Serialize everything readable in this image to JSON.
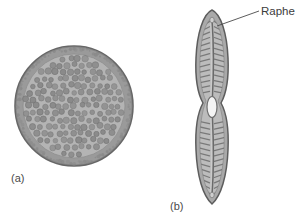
{
  "figure": {
    "type": "scientific-illustration",
    "background_color": "#ffffff",
    "width": 297,
    "height": 222
  },
  "panels": [
    {
      "id": "a",
      "label": "(a)",
      "label_x": 11,
      "label_y": 178,
      "shape": "centric",
      "description": "Circular centric diatom valve seen in valve view, with a granular marginal rim and numerous rounded areolae (pores) covering the face",
      "center_x": 74,
      "center_y": 106,
      "radius_x": 59,
      "radius_y": 60,
      "colors": {
        "rim_outer": "#6e6e6e",
        "rim_band": "#8f8f8f",
        "face_fill": "#b3b3b3",
        "areola_fill": "#8a8a8a",
        "areola_stroke": "#6f6f6f"
      },
      "areola_count": 168,
      "rim_granule_count": 120
    },
    {
      "id": "b",
      "label": "(b)",
      "label_x": 170,
      "label_y": 206,
      "shape": "pennate",
      "description": "Elongate pennate diatom valve with a longitudinal raphe slit, a central nodule, and transverse striae running perpendicular to the raphe on both sides",
      "center_x": 212,
      "center_y": 107,
      "length": 196,
      "width": 33,
      "colors": {
        "outline": "#5f5f5f",
        "body_fill": "#a8a8a8",
        "inner_fill": "#b8b8b8",
        "stria_stroke": "#707070",
        "raphe_stroke": "#6a6a6a",
        "central_nodule_fill": "#f2f2f2"
      },
      "stria_pairs": 34,
      "central_nodule": {
        "x": 212,
        "y": 107,
        "rx": 5,
        "ry": 10
      }
    }
  ],
  "annotations": [
    {
      "name": "raphe",
      "text": "Raphe",
      "text_x": 262,
      "text_y": 15,
      "leader": {
        "x1": 259,
        "y1": 11,
        "x2": 217,
        "y2": 26
      },
      "color": "#3c3c3c"
    }
  ]
}
